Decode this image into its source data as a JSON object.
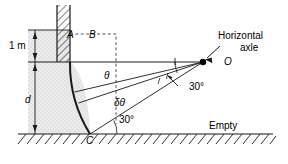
{
  "figure": {
    "colors": {
      "line": "#1a1a1a",
      "water_fill": "#e8e8ee",
      "hatch": "#1a1a1a",
      "text": "#000000"
    }
  },
  "labels": {
    "point_a": "A",
    "point_b": "B",
    "point_c": "C",
    "point_o": "O",
    "depth_one_meter": "1 m",
    "depth_d": "d",
    "theta": "θ",
    "delta_theta": "δθ",
    "angle_at_axle": "30°",
    "angle_at_c": "30°",
    "axle_caption_line1": "Horizontal",
    "axle_caption_line2": "axle",
    "empty_region": "Empty"
  },
  "geometry": {
    "axle_point": {
      "x": 203,
      "y": 62
    },
    "point_c": {
      "x": 90,
      "y": 134
    },
    "ground_y": 134,
    "water_surface_y": 30,
    "gate_top_y": 62,
    "wall_x_left": 57,
    "wall_x_right": 70,
    "radius_px": 133,
    "arc_angles_deg": {
      "top": 0,
      "bottom": 30
    },
    "radial_lines_deg": [
      0,
      13,
      18,
      30
    ]
  }
}
